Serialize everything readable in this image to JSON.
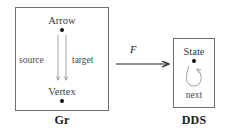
{
  "figure": {
    "left_box": {
      "caption": "Gr",
      "nodes": [
        {
          "name": "arrow-node",
          "label": "Arrow"
        },
        {
          "name": "vertex-node",
          "label": "Vertex"
        }
      ],
      "edges": [
        {
          "name": "source-edge",
          "label": "source",
          "from": "Arrow",
          "to": "Vertex"
        },
        {
          "name": "target-edge",
          "label": "target",
          "from": "Arrow",
          "to": "Vertex"
        }
      ]
    },
    "right_box": {
      "caption": "DDS",
      "nodes": [
        {
          "name": "state-node",
          "label": "State"
        }
      ],
      "edges": [
        {
          "name": "next-loop",
          "label": "next",
          "from": "State",
          "to": "State"
        }
      ]
    },
    "functor": {
      "label": "F",
      "from": "Gr",
      "to": "DDS"
    },
    "colors": {
      "box_border": "#6e6e6e",
      "node_dot": "#111111",
      "edge_stroke": "#8a8a8a",
      "functor_stroke": "#1a1a1a",
      "text": "#3a3a3a",
      "caption_text": "#1a1a1a",
      "background": "#ffffff"
    }
  }
}
